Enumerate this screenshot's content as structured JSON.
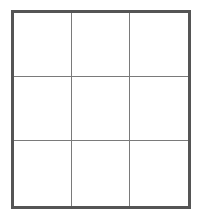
{
  "grid": {
    "rows": 3,
    "columns": 3,
    "border_color": "#555555",
    "line_color": "#7a7a7a",
    "cells": [
      {
        "row": 1,
        "col": 1,
        "value": ""
      },
      {
        "row": 1,
        "col": 2,
        "value": ""
      },
      {
        "row": 1,
        "col": 3,
        "value": ""
      },
      {
        "row": 2,
        "col": 1,
        "value": ""
      },
      {
        "row": 2,
        "col": 2,
        "value": ""
      },
      {
        "row": 2,
        "col": 3,
        "value": ""
      },
      {
        "row": 3,
        "col": 1,
        "value": ""
      },
      {
        "row": 3,
        "col": 2,
        "value": ""
      },
      {
        "row": 3,
        "col": 3,
        "value": ""
      }
    ]
  }
}
